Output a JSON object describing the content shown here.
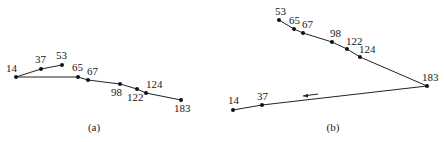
{
  "diagrams": [
    {
      "id": "a",
      "caption": "(a)",
      "caption_pos": [
        94,
        131
      ],
      "path_order": [
        "53",
        "37",
        "14",
        "65",
        "67",
        "98",
        "122",
        "124",
        "183"
      ],
      "nodes": [
        {
          "label": "14",
          "x": 16,
          "y": 77,
          "lx": 6,
          "ly": 72
        },
        {
          "label": "37",
          "x": 41,
          "y": 69,
          "lx": 35,
          "ly": 63
        },
        {
          "label": "53",
          "x": 62,
          "y": 65,
          "lx": 56,
          "ly": 59
        },
        {
          "label": "65",
          "x": 78,
          "y": 77,
          "lx": 72,
          "ly": 71
        },
        {
          "label": "67",
          "x": 88,
          "y": 80,
          "lx": 87,
          "ly": 75
        },
        {
          "label": "98",
          "x": 120,
          "y": 84,
          "lx": 111,
          "ly": 96
        },
        {
          "label": "122",
          "x": 137,
          "y": 89,
          "lx": 127,
          "ly": 101
        },
        {
          "label": "124",
          "x": 146,
          "y": 93,
          "lx": 146,
          "ly": 88
        },
        {
          "label": "183",
          "x": 181,
          "y": 100,
          "lx": 174,
          "ly": 112
        }
      ]
    },
    {
      "id": "b",
      "caption": "(b)",
      "caption_pos": [
        333,
        131
      ],
      "path_order": [
        "53",
        "65",
        "67",
        "98",
        "122",
        "124",
        "183",
        "37",
        "14"
      ],
      "direction_arrow": {
        "x1": 318,
        "y1": 94,
        "x2": 303,
        "y2": 96,
        "meaning": "arrow-left"
      },
      "nodes": [
        {
          "label": "53",
          "x": 279,
          "y": 20,
          "lx": 275,
          "ly": 15
        },
        {
          "label": "65",
          "x": 294,
          "y": 29,
          "lx": 289,
          "ly": 24
        },
        {
          "label": "67",
          "x": 303,
          "y": 33,
          "lx": 302,
          "ly": 28
        },
        {
          "label": "98",
          "x": 332,
          "y": 42,
          "lx": 330,
          "ly": 37
        },
        {
          "label": "122",
          "x": 347,
          "y": 49,
          "lx": 346,
          "ly": 45
        },
        {
          "label": "124",
          "x": 360,
          "y": 57,
          "lx": 359,
          "ly": 53
        },
        {
          "label": "183",
          "x": 427,
          "y": 86,
          "lx": 422,
          "ly": 81
        },
        {
          "label": "37",
          "x": 262,
          "y": 105,
          "lx": 257,
          "ly": 100
        },
        {
          "label": "14",
          "x": 233,
          "y": 110,
          "lx": 228,
          "ly": 104
        }
      ]
    }
  ]
}
